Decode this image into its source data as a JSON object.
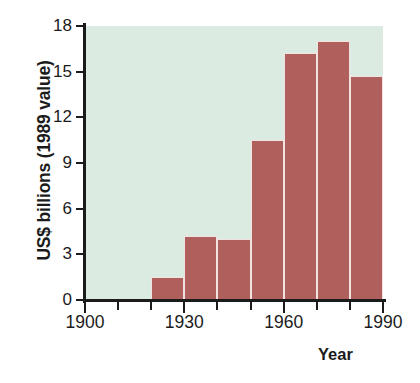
{
  "chart_data": {
    "type": "bar",
    "title": "",
    "xlabel": "Year",
    "ylabel": "US$ billions (1989 value)",
    "categories": [
      "1920",
      "1930",
      "1940",
      "1950",
      "1960",
      "1970",
      "1980"
    ],
    "values": [
      1.5,
      4.2,
      4.0,
      10.5,
      16.2,
      17.0,
      14.7
    ],
    "bar_width_years": 10,
    "xlim": [
      1900,
      1990
    ],
    "ylim": [
      0,
      18
    ],
    "y_ticks": [
      0,
      3,
      6,
      9,
      12,
      15,
      18
    ],
    "x_ticks_major": [
      1900,
      1930,
      1960,
      1990
    ],
    "x_ticks_minor": [
      1910,
      1920,
      1940,
      1950,
      1970,
      1980
    ],
    "grid": false,
    "legend": "none",
    "colors": {
      "bar": "#b0605c",
      "bar_edge": "#f2e3e0",
      "plot_background": "#dcebe2",
      "axis": "#1b1b1b",
      "text": "#1b1b1b"
    }
  },
  "axes": {
    "y_title": "US$ billions (1989 value)",
    "x_title": "Year",
    "y_tick_labels": [
      "18",
      "15",
      "12",
      "9",
      "6",
      "3",
      "0"
    ],
    "x_tick_labels": [
      "1900",
      "1930",
      "1960",
      "1990"
    ]
  }
}
